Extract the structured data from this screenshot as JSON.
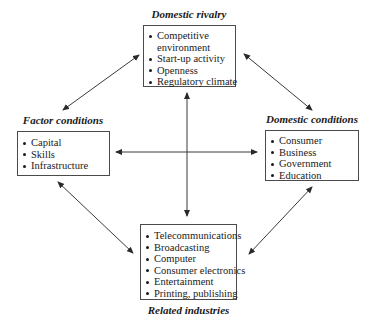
{
  "diagram": {
    "type": "porter-diamond",
    "nodes": {
      "domestic_rivalry": {
        "title": "Domestic rivalry",
        "items": [
          "Competitive",
          "environment",
          "Start-up activity",
          "Openness",
          "Regulatory climate"
        ]
      },
      "factor_conditions": {
        "title": "Factor conditions",
        "items": [
          "Capital",
          "Skills",
          "Infrastructure"
        ]
      },
      "domestic_conditions": {
        "title": "Domestic conditions",
        "items": [
          "Consumer",
          "Business",
          "Government",
          "Education"
        ]
      },
      "related_industries": {
        "title": "Related industries",
        "items": [
          "Telecommunications",
          "Broadcasting",
          "Computer",
          "Consumer electronics",
          "Entertainment",
          "Printing, publishing"
        ]
      }
    },
    "edges": [
      {
        "from": "domestic_rivalry",
        "to": "factor_conditions",
        "direction": "bidirectional"
      },
      {
        "from": "domestic_rivalry",
        "to": "domestic_conditions",
        "direction": "bidirectional"
      },
      {
        "from": "factor_conditions",
        "to": "related_industries",
        "direction": "bidirectional"
      },
      {
        "from": "domestic_conditions",
        "to": "related_industries",
        "direction": "bidirectional"
      },
      {
        "from": "domestic_rivalry",
        "to": "related_industries",
        "direction": "bidirectional"
      },
      {
        "from": "factor_conditions",
        "to": "domestic_conditions",
        "direction": "bidirectional"
      }
    ],
    "colors": {
      "line": "#3a3a3a",
      "box_border": "#4a4a4a",
      "text": "#1a1a1a",
      "background": "#ffffff"
    }
  }
}
